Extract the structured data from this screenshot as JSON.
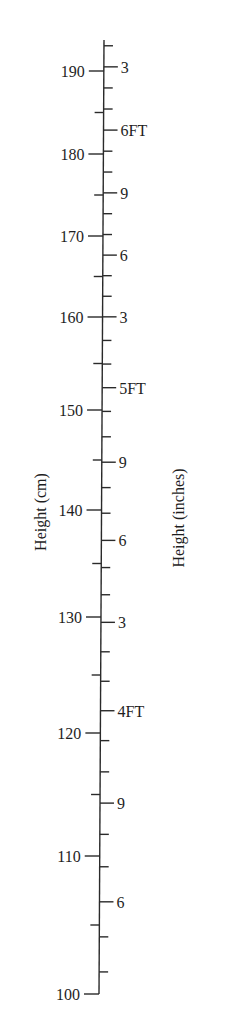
{
  "chart_data": {
    "type": "scale",
    "title": "",
    "left_axis": {
      "label": "Height (cm)",
      "range": [
        100,
        193.7
      ],
      "major_ticks": [
        100,
        110,
        120,
        130,
        140,
        150,
        160,
        170,
        180,
        190
      ],
      "tick_labels": [
        "100",
        "110",
        "120",
        "130",
        "140",
        "150",
        "160",
        "170",
        "180",
        "190"
      ],
      "minor_ticks": [
        105,
        115,
        125,
        135,
        145,
        155,
        165,
        175,
        185
      ]
    },
    "right_axis": {
      "label": "Height (inches)",
      "unit_tick_inches": [
        40,
        41,
        42,
        43,
        44,
        45,
        46,
        47,
        48,
        49,
        50,
        51,
        52,
        53,
        54,
        55,
        56,
        57,
        58,
        59,
        60,
        61,
        62,
        63,
        64,
        65,
        66,
        67,
        68,
        69,
        70,
        71,
        72,
        73,
        74,
        75,
        76
      ],
      "labeled_ticks": [
        {
          "inches": 42,
          "label": "6"
        },
        {
          "inches": 45,
          "label": "9"
        },
        {
          "inches": 48,
          "label": "4FT"
        },
        {
          "inches": 51,
          "label": "3"
        },
        {
          "inches": 54,
          "label": "6"
        },
        {
          "inches": 57,
          "label": "9"
        },
        {
          "inches": 60,
          "label": "5FT"
        },
        {
          "inches": 63,
          "label": "3"
        },
        {
          "inches": 66,
          "label": "6"
        },
        {
          "inches": 69,
          "label": "9"
        },
        {
          "inches": 72,
          "label": "6FT"
        },
        {
          "inches": 75,
          "label": "3"
        }
      ]
    },
    "pixel_calibration_cm_to_y": [
      [
        190,
        71
      ],
      [
        180,
        154
      ],
      [
        170,
        236
      ],
      [
        160,
        317
      ],
      [
        150,
        410
      ],
      [
        140,
        510
      ],
      [
        130,
        617
      ],
      [
        120,
        733
      ],
      [
        110,
        856
      ],
      [
        100,
        994
      ]
    ],
    "axis_top_y": 40,
    "grid": false,
    "legend": null
  }
}
